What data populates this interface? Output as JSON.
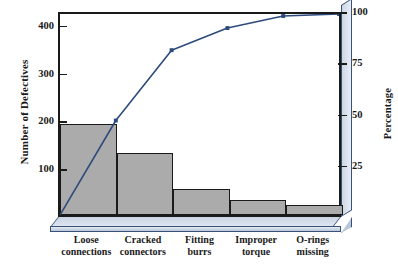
{
  "chart_data": {
    "type": "bar",
    "title": "",
    "subtitle": "",
    "xlabel": "",
    "ylabel": "Number of Defectives",
    "y2label": "Percentage",
    "categories": [
      "Loose connections",
      "Cracked connectors",
      "Fitting burrs",
      "Improper torque",
      "O-rings missing"
    ],
    "category_lines": [
      [
        "Loose",
        "connections"
      ],
      [
        "Cracked",
        "connectors"
      ],
      [
        "Fitting",
        "burrs"
      ],
      [
        "Improper",
        "torque"
      ],
      [
        "O-rings",
        "missing"
      ]
    ],
    "values": [
      190,
      130,
      55,
      32,
      22
    ],
    "cumulative_percent": [
      47,
      82,
      93,
      99,
      100
    ],
    "total_defectives": 429,
    "ylim": [
      0,
      429
    ],
    "y2lim": [
      0,
      100
    ],
    "yticks": [
      100,
      200,
      300,
      400
    ],
    "ytick_labels": [
      "100",
      "200",
      "300",
      "400"
    ],
    "y2ticks": [
      25,
      50,
      75,
      100
    ],
    "y2tick_labels": [
      "25",
      "50",
      "75",
      "100"
    ],
    "grid": false,
    "legend": false,
    "legend_position": "none",
    "series": [
      {
        "name": "Number of Defectives",
        "type": "bar",
        "values": [
          190,
          130,
          55,
          32,
          22
        ]
      },
      {
        "name": "Cumulative Percentage",
        "type": "line",
        "values": [
          47,
          82,
          93,
          99,
          100
        ]
      }
    ]
  },
  "colors": {
    "bar_fill": "#ababab",
    "bar_stroke": "#1a1a1a",
    "line": "#2d4a7c",
    "marker": "#2d4a7c",
    "axis": "#1a1a1a",
    "plinth": "#c9d4e3",
    "plinth_edge": "#39507a",
    "background": "#ffffff",
    "text": "#1a1a1a"
  }
}
